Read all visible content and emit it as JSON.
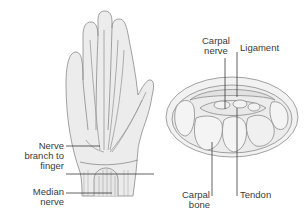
{
  "diagram": {
    "colors": {
      "outline": "#8a8a8a",
      "fill": "#ececec",
      "fill_light": "#f4f4f4",
      "leader": "#3a3a3a",
      "text": "#3a3a3a",
      "background": "#ffffff"
    },
    "panels": [
      {
        "name": "hand-palm-view",
        "labels": [
          {
            "id": "nerve_branch",
            "text": "Nerve\nbranch to\nfinger"
          },
          {
            "id": "median_nerve",
            "text": "Median\nnerve"
          }
        ]
      },
      {
        "name": "wrist-cross-section",
        "labels": [
          {
            "id": "carpal_nerve",
            "text": "Carpal\nnerve"
          },
          {
            "id": "ligament",
            "text": "Ligament"
          },
          {
            "id": "carpal_bone",
            "text": "Carpal\nbone"
          },
          {
            "id": "tendon",
            "text": "Tendon"
          }
        ]
      }
    ]
  },
  "labels": {
    "nerve_branch": "Nerve\nbranch to\nfinger",
    "median_nerve": "Median\nnerve",
    "carpal_nerve": "Carpal\nnerve",
    "ligament": "Ligament",
    "carpal_bone": "Carpal\nbone",
    "tendon": "Tendon"
  }
}
